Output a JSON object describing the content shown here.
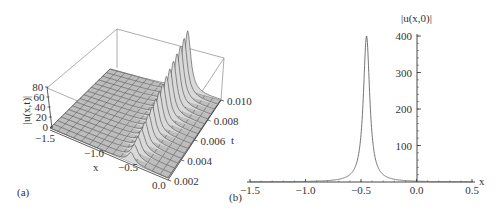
{
  "figure": {
    "panels": [
      {
        "id": "a",
        "label": "(a)"
      },
      {
        "id": "b",
        "label": "(b)"
      }
    ]
  },
  "chart_data": [
    {
      "panel": "(a)",
      "type": "surface3d",
      "title": "",
      "zlabel": "|u(x,t)|",
      "xlabel": "x",
      "ylabel": "t",
      "z_ticks": [
        "0",
        "20",
        "40",
        "60",
        "80"
      ],
      "x_ticks": [
        "-1.5",
        "-1.0",
        "-0.5",
        "0.0"
      ],
      "t_ticks": [
        "0.002",
        "0.004",
        "0.006",
        "0.008",
        "0.010"
      ],
      "xlim": [
        -1.5,
        0.0
      ],
      "tlim": [
        0.002,
        0.01
      ],
      "zlim": [
        0,
        80
      ],
      "description": "Sharp ridge localized near x = -0.45 across all t; surface ~0 elsewhere, ridge grows toward larger t",
      "grid": true
    },
    {
      "panel": "(b)",
      "type": "line",
      "title": "",
      "xlabel": "x",
      "ylabel": "|u(x,0)|",
      "x_ticks": [
        "-1.5",
        "-1.0",
        "-0.5",
        "0.0",
        "0.5"
      ],
      "y_ticks": [
        "100",
        "200",
        "300",
        "400"
      ],
      "xlim": [
        -1.5,
        0.5
      ],
      "ylim": [
        0,
        400
      ],
      "series": [
        {
          "name": "|u(x,0)|",
          "x": [
            -1.5,
            -1.0,
            -0.8,
            -0.7,
            -0.6,
            -0.55,
            -0.5,
            -0.48,
            -0.47,
            -0.46,
            -0.455,
            -0.45,
            -0.445,
            -0.44,
            -0.43,
            -0.42,
            -0.4,
            -0.35,
            -0.3,
            -0.2,
            0.0,
            0.5
          ],
          "values": [
            0.5,
            1.5,
            2.5,
            4,
            7,
            11,
            20,
            35,
            55,
            110,
            200,
            400,
            200,
            110,
            55,
            35,
            20,
            10,
            6,
            3,
            1,
            0.3
          ]
        }
      ],
      "peak": {
        "x": -0.45,
        "y": 400
      },
      "grid": false
    }
  ]
}
